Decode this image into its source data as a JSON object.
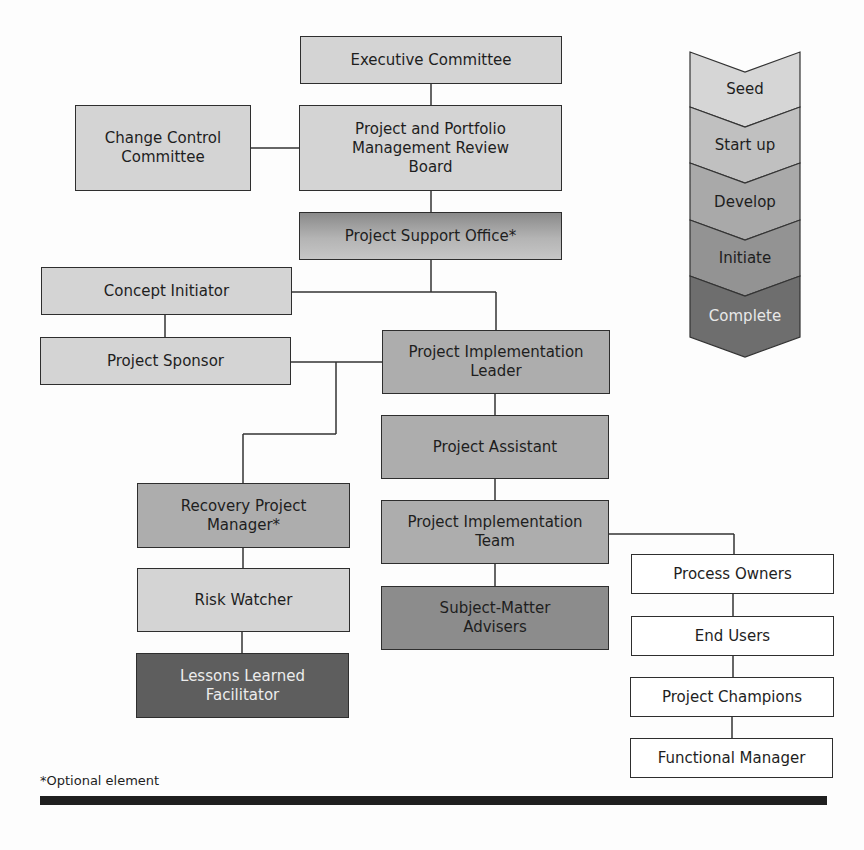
{
  "diagram": {
    "type": "org-chart",
    "nodes": {
      "executive_committee": "Executive Committee",
      "ppm_review_board": "Project and Portfolio Management Review Board",
      "change_control_committee": "Change Control Committee",
      "project_support_office": "Project Support Office*",
      "concept_initiator": "Concept Initiator",
      "project_sponsor": "Project Sponsor",
      "project_implementation_leader": "Project Implementation Leader",
      "project_assistant": "Project Assistant",
      "project_implementation_team": "Project Implementation Team",
      "subject_matter_advisers": "Subject-Matter Advisers",
      "recovery_project_manager": "Recovery Project Manager*",
      "risk_watcher": "Risk Watcher",
      "lessons_learned_facilitator": "Lessons Learned Facilitator",
      "process_owners": "Process Owners",
      "end_users": "End Users",
      "project_champions": "Project Champions",
      "functional_manager": "Functional Manager"
    },
    "phases": [
      "Seed",
      "Start up",
      "Develop",
      "Initiate",
      "Complete"
    ],
    "phase_colors": [
      "#d6d6d6",
      "#c0c0c0",
      "#a9a9a9",
      "#939393",
      "#6e6e6e"
    ],
    "footnote": "*Optional element"
  }
}
